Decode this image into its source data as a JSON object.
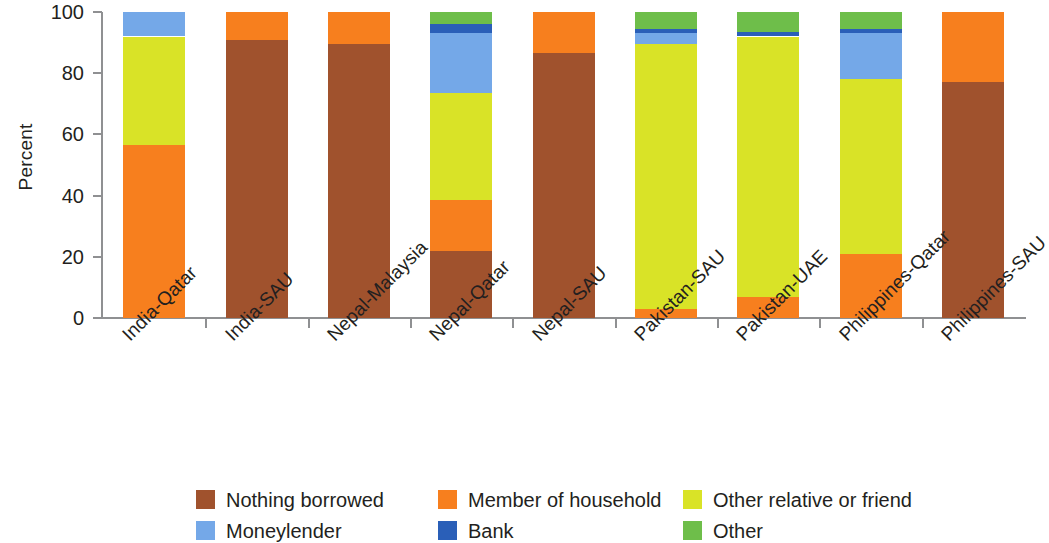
{
  "chart_data": {
    "type": "bar",
    "subtype": "stacked-bar-100-percent",
    "title": "",
    "xlabel": "",
    "ylabel": "Percent",
    "ylim": [
      0,
      100
    ],
    "yticks": [
      0,
      20,
      40,
      60,
      80,
      100
    ],
    "grid": false,
    "legend_position": "bottom",
    "categories": [
      "India-Qatar",
      "India-SAU",
      "Nepal-Malaysia",
      "Nepal-Qatar",
      "Nepal-SAU",
      "Pakistan-SAU",
      "Pakistan-UAE",
      "Philippines-Qatar",
      "Philippines-SAU"
    ],
    "series": [
      {
        "name": "Nothing borrowed",
        "color": "#a0522d",
        "values": [
          0,
          91,
          89.5,
          22,
          86.5,
          0,
          0,
          0,
          77
        ]
      },
      {
        "name": "Member of household",
        "color": "#f77f1e",
        "values": [
          56.5,
          9,
          10.5,
          16.5,
          13.5,
          3,
          7,
          21,
          23
        ]
      },
      {
        "name": "Other relative or friend",
        "color": "#d9e327",
        "values": [
          35.5,
          0,
          0,
          35,
          0,
          86.5,
          85,
          57,
          0
        ]
      },
      {
        "name": "Moneylender",
        "color": "#74a8e8",
        "values": [
          8,
          0,
          0,
          19.5,
          0,
          3.5,
          0,
          15,
          0
        ]
      },
      {
        "name": "Bank",
        "color": "#2a5fb8",
        "values": [
          0,
          0,
          0,
          3,
          0,
          1.5,
          1.5,
          1.5,
          0
        ]
      },
      {
        "name": "Other",
        "color": "#6ebe4a",
        "values": [
          0,
          0,
          0,
          4,
          0,
          5.5,
          6.5,
          5.5,
          0
        ]
      }
    ]
  },
  "axes": {
    "y_title": "Percent",
    "y_tick_labels": [
      "0",
      "20",
      "40",
      "60",
      "80",
      "100"
    ]
  },
  "legend": {
    "items": [
      {
        "label": "Nothing borrowed",
        "color": "#a0522d"
      },
      {
        "label": "Member of household",
        "color": "#f77f1e"
      },
      {
        "label": "Other relative or friend",
        "color": "#d9e327"
      },
      {
        "label": "Moneylender",
        "color": "#74a8e8"
      },
      {
        "label": "Bank",
        "color": "#2a5fb8"
      },
      {
        "label": "Other",
        "color": "#6ebe4a"
      }
    ]
  }
}
